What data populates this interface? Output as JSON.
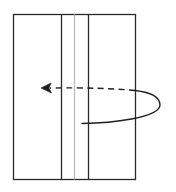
{
  "diagram": {
    "type": "fold-instruction",
    "colors": {
      "outline": "#2a2a2a",
      "crease": "#b8b8b8",
      "arrow": "#1e1e1e",
      "background": "#ffffff"
    },
    "paper": {
      "x": 13,
      "y": 14,
      "width": 122,
      "height": 165
    },
    "fold_lines": [
      {
        "x": 61,
        "style": "solid",
        "role": "fold-line-left"
      },
      {
        "x": 88,
        "style": "solid",
        "role": "fold-line-right"
      }
    ],
    "crease_lines": [
      {
        "x": 74,
        "style": "solid-light",
        "role": "center-crease"
      }
    ],
    "arrow": {
      "start": {
        "x": 82,
        "y": 123
      },
      "loop_extent_x": 160,
      "hidden_segment": "dashed",
      "visible_segment": "solid",
      "head": {
        "x": 41,
        "y": 88,
        "direction": "left"
      }
    }
  }
}
